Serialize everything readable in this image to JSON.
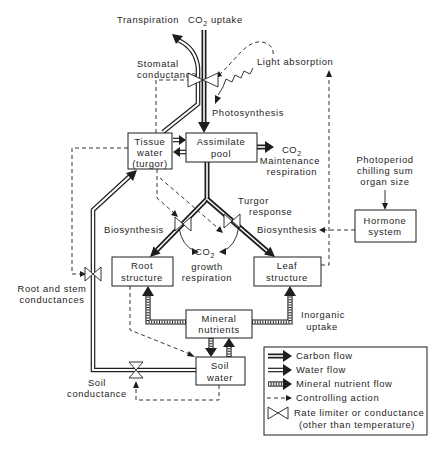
{
  "top": {
    "transpiration": "Transpiration",
    "co2_uptake": {
      "main": "CO",
      "sub": "2",
      "rest": " uptake"
    },
    "stomatal": [
      "Stomatal",
      "conductance"
    ],
    "light_absorption": "Light absorption",
    "photosynthesis": "Photosynthesis"
  },
  "boxes": {
    "tissue_water": [
      "Tissue",
      "water",
      "(turgor)"
    ],
    "assimilate_pool": [
      "Assimilate",
      "pool"
    ],
    "hormone_system": [
      "Hormone",
      "system"
    ],
    "root_structure": [
      "Root",
      "structure"
    ],
    "leaf_structure": [
      "Leaf",
      "structure"
    ],
    "mineral_nutrients": [
      "Mineral",
      "nutrients"
    ],
    "soil_water": [
      "Soil",
      "water"
    ]
  },
  "labels": {
    "maintenance_co2": {
      "main": "CO",
      "sub": "2"
    },
    "maintenance_respiration": [
      "Maintenance",
      "respiration"
    ],
    "photoperiod": [
      "Photoperiod",
      "chilling sum",
      "organ size"
    ],
    "turgor_response": [
      "Turgor",
      "response"
    ],
    "biosynthesis_left": "Biosynthesis",
    "biosynthesis_right": "Biosynthesis",
    "growth_co2": {
      "main": "CO",
      "sub": "2"
    },
    "growth_respiration": [
      "growth",
      "respiration"
    ],
    "root_stem_conductances": [
      "Root and stem",
      "conductances"
    ],
    "inorganic_uptake": [
      "Inorganic",
      "uptake"
    ],
    "soil_conductance": [
      "Soil",
      "conductance"
    ]
  },
  "legend": {
    "items": [
      {
        "symbol": "carbon-flow-arrow",
        "label": "Carbon flow"
      },
      {
        "symbol": "water-flow-arrow",
        "label": "Water flow"
      },
      {
        "symbol": "mineral-nutrient-flow-arrow",
        "label": "Mineral nutrient flow"
      },
      {
        "symbol": "controlling-action-dashed-arrow",
        "label": "Controlling action"
      },
      {
        "symbol": "rate-limiter-bowtie",
        "label": "Rate limiter or conductance",
        "label2": "(other than temperature)"
      }
    ]
  },
  "colors": {
    "ink": "#1e1e1e",
    "paper": "#ffffff"
  }
}
